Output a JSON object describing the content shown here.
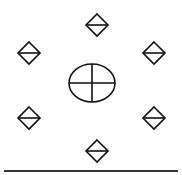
{
  "diagram": {
    "width": 182,
    "height": 175,
    "background": "#ffffff",
    "stroke_color": "#111111",
    "ground_line_color": "#333333",
    "center_symbol": {
      "type": "ellipse-with-cross",
      "cx": 92,
      "cy": 83,
      "rx": 23,
      "ry": 19
    },
    "diamonds": [
      {
        "id": "top",
        "cx": 97,
        "cy": 25,
        "r": 11
      },
      {
        "id": "upper-left",
        "cx": 29,
        "cy": 53,
        "r": 11
      },
      {
        "id": "upper-right",
        "cx": 154,
        "cy": 53,
        "r": 11
      },
      {
        "id": "lower-left",
        "cx": 29,
        "cy": 118,
        "r": 11
      },
      {
        "id": "lower-right",
        "cx": 154,
        "cy": 118,
        "r": 11
      },
      {
        "id": "bottom",
        "cx": 97,
        "cy": 151,
        "r": 11
      }
    ],
    "ground_line": {
      "x1": 4,
      "x2": 178,
      "y": 171
    }
  }
}
